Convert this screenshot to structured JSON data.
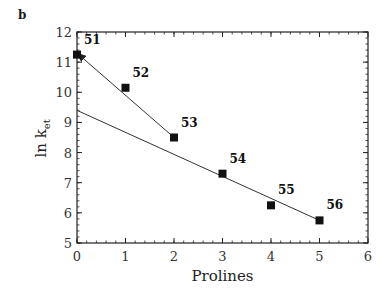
{
  "panel_label": "b",
  "chart_data": {
    "type": "scatter",
    "title": "",
    "xlabel": "Prolines",
    "ylabel": "ln k",
    "ylabel_subscript": "et",
    "xlim": [
      0,
      6
    ],
    "ylim": [
      5,
      12
    ],
    "xticks": [
      0,
      1,
      2,
      3,
      4,
      5,
      6
    ],
    "yticks": [
      5,
      6,
      7,
      8,
      9,
      10,
      11,
      12
    ],
    "grid": false,
    "legend": null,
    "series": [
      {
        "name": "data",
        "marker": "square",
        "points": [
          {
            "x": 0,
            "y": 11.25,
            "label": "51"
          },
          {
            "x": 1,
            "y": 10.15,
            "label": "52"
          },
          {
            "x": 2,
            "y": 8.5,
            "label": "53"
          },
          {
            "x": 3,
            "y": 7.3,
            "label": "54"
          },
          {
            "x": 4,
            "y": 6.25,
            "label": "55"
          },
          {
            "x": 5,
            "y": 5.75,
            "label": "56"
          }
        ]
      }
    ],
    "lines": [
      {
        "name": "fit-short",
        "from": [
          2,
          8.5
        ],
        "to": [
          0,
          11.3
        ],
        "arrow_end": true
      },
      {
        "name": "fit-long",
        "from": [
          0,
          9.4
        ],
        "to": [
          5,
          5.75
        ],
        "arrow_end": false
      }
    ]
  }
}
